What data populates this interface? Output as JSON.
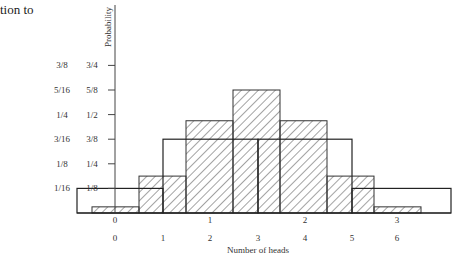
{
  "page_fragment_text": "tion to",
  "chart_data": {
    "type": "bar",
    "title": "",
    "xlabel": "Number of heads",
    "ylabel": "Probability",
    "y_ticks_outer": [
      "1/16",
      "1/8",
      "3/16",
      "1/4",
      "5/16",
      "3/8"
    ],
    "y_ticks_inner": [
      "1/8",
      "1/4",
      "3/8",
      "1/2",
      "5/8",
      "3/4"
    ],
    "grid": false,
    "legend": null,
    "series": [
      {
        "name": "6 tosses (hatched)",
        "style": "hatched",
        "categories": [
          "0",
          "1",
          "2",
          "3",
          "4",
          "5",
          "6"
        ],
        "values": [
          0.015625,
          0.09375,
          0.234375,
          0.3125,
          0.234375,
          0.09375,
          0.015625
        ],
        "values_fraction": [
          "1/64",
          "6/64",
          "15/64",
          "20/64",
          "15/64",
          "6/64",
          "1/64"
        ],
        "scale": "outer"
      },
      {
        "name": "3 tosses (outline)",
        "style": "outline",
        "categories": [
          "0",
          "1",
          "2",
          "3"
        ],
        "values": [
          0.125,
          0.375,
          0.375,
          0.125
        ],
        "values_fraction": [
          "1/8",
          "3/8",
          "3/8",
          "1/8"
        ],
        "scale": "inner"
      }
    ],
    "x_labels_upper": [
      "0",
      "1",
      "2",
      "3"
    ],
    "x_labels_lower": [
      "0",
      "1",
      "2",
      "3",
      "4",
      "5",
      "6"
    ]
  }
}
